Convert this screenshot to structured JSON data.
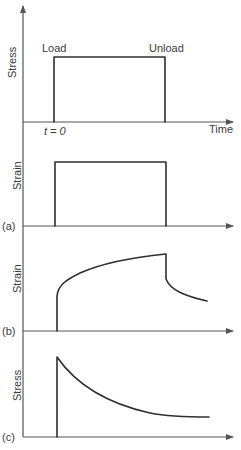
{
  "figure": {
    "top_plot": {
      "ylabel": "Stress",
      "xlabel": "Time",
      "load_label": "Load",
      "unload_label": "Unload",
      "t0_label": "t = 0"
    },
    "panel_a": {
      "tag": "(a)",
      "ylabel": "Strain",
      "description": "Elastic: strain follows stress step instantly"
    },
    "panel_b": {
      "tag": "(b)",
      "ylabel": "Strain",
      "description": "Creep: instantaneous strain then slow increase; partial recovery on unload"
    },
    "panel_c": {
      "tag": "(c)",
      "ylabel": "Stress",
      "description": "Stress relaxation: stress decays at constant strain"
    }
  },
  "colors": {
    "line": "#2f2f2f",
    "axis": "#555555",
    "text": "#3a3a3a",
    "background": "#ffffff"
  }
}
